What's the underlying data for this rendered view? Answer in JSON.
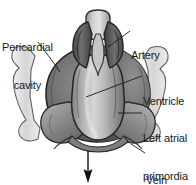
{
  "figure": {
    "background_color": "#ffffff",
    "ink_color": "#1a1a1a"
  },
  "labels": [
    {
      "id": "pericardial",
      "text": "Pericardial\ncavity",
      "line1": "Pericardial",
      "line2": "cavity",
      "side": "left"
    },
    {
      "id": "artery",
      "text": "Artery",
      "line1": "Artery",
      "line2": "",
      "side": "right"
    },
    {
      "id": "ventricle",
      "text": "Ventricle",
      "line1": "Ventricle",
      "line2": "",
      "side": "right"
    },
    {
      "id": "left_atrial",
      "text": "Left atrial\nprimordia",
      "line1": "Left atrial",
      "line2": "primordia",
      "side": "right"
    },
    {
      "id": "vein",
      "text": "Vein",
      "line1": "Vein",
      "line2": "",
      "side": "right"
    }
  ],
  "annotations": {
    "flow_arrow": {
      "name": "downward-arrow",
      "direction": "down",
      "from": [
        88,
        150
      ],
      "to": [
        88,
        182
      ]
    }
  },
  "palette": {
    "outflow_light": "#d8d8d8",
    "outflow_mid": "#a8a8a8",
    "pericardium_dark": "#5a5a5a",
    "pericardium_mid": "#7d7d7d",
    "ventricle_light": "#c8c8c8",
    "ventricle_shadow": "#8b8b8b",
    "atrial_mid": "#909090",
    "outline": "#2b2b2b",
    "wing_pale": "#e2e2e2"
  },
  "structures": [
    {
      "name": "pericardial-cavity",
      "label_ref": "pericardial"
    },
    {
      "name": "artery-outflow-tract",
      "label_ref": "artery"
    },
    {
      "name": "ventricle",
      "label_ref": "ventricle"
    },
    {
      "name": "left-atrial-primordia",
      "label_ref": "left_atrial"
    },
    {
      "name": "vein",
      "label_ref": "vein"
    }
  ]
}
